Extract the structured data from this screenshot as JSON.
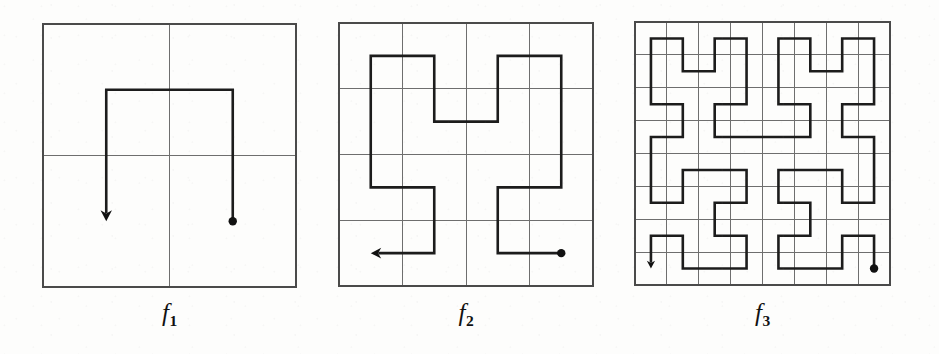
{
  "figure": {
    "background_color": "#fdfdfc",
    "width": 939,
    "height": 354
  },
  "style": {
    "grid_color": "#6e6e6e",
    "grid_width": 1,
    "curve_color": "#1c1c1c",
    "curve_width": 2.6,
    "dot_color": "#111111",
    "dot_radius": 4.2,
    "arrow_color": "#111111",
    "label_color": "#111111"
  },
  "panels": [
    {
      "id": "panel-f1",
      "label": "f",
      "label_subscript": "1",
      "order": 1,
      "grid_divisions": 2,
      "box": {
        "x": 43,
        "y": 24,
        "width": 253,
        "height": 263
      },
      "label_y": 300,
      "start_marker": "dot",
      "end_marker": "arrow",
      "end_direction": "down",
      "segments": 3,
      "cells": 4
    },
    {
      "id": "panel-f2",
      "label": "f",
      "label_subscript": "2",
      "order": 2,
      "grid_divisions": 4,
      "box": {
        "x": 339,
        "y": 23,
        "width": 254,
        "height": 263
      },
      "label_y": 300,
      "start_marker": "dot",
      "end_marker": "arrow",
      "end_direction": "left",
      "segments": 15,
      "cells": 16
    },
    {
      "id": "panel-f3",
      "label": "f",
      "label_subscript": "3",
      "order": 3,
      "grid_divisions": 8,
      "box": {
        "x": 635,
        "y": 22,
        "width": 255,
        "height": 263
      },
      "label_y": 300,
      "start_marker": "dot",
      "end_marker": "arrow",
      "end_direction": "down",
      "segments": 63,
      "cells": 64
    }
  ],
  "chart_data": {
    "type": "line",
    "xlabel": "",
    "ylabel": "",
    "grid": true,
    "legend": "none",
    "series": [
      {
        "name": "f1",
        "divisions": 2,
        "note": "Path visits all 4 cells of a 2x2 grid; starts at dot in lower-right cell, ends with arrow pointing down in lower-left cell.",
        "cell_path": [
          [
            1,
            0
          ],
          [
            1,
            1
          ],
          [
            0,
            1
          ],
          [
            0,
            0
          ]
        ]
      },
      {
        "name": "f2",
        "divisions": 4,
        "note": "Path visits all 16 cells of a 4x4 grid; starts at dot in lower-right cell, ends with arrow pointing left in lower-left cell.",
        "cell_path": [
          [
            3,
            0
          ],
          [
            2,
            0
          ],
          [
            2,
            1
          ],
          [
            3,
            1
          ],
          [
            3,
            2
          ],
          [
            3,
            3
          ],
          [
            2,
            3
          ],
          [
            2,
            2
          ],
          [
            1,
            2
          ],
          [
            1,
            3
          ],
          [
            0,
            3
          ],
          [
            0,
            2
          ],
          [
            0,
            1
          ],
          [
            1,
            1
          ],
          [
            1,
            0
          ],
          [
            0,
            0
          ]
        ]
      },
      {
        "name": "f3",
        "divisions": 8,
        "note": "Path visits all 64 cells of an 8x8 grid; starts at dot in lower-right cell, ends with arrow pointing down in lower-left cell."
      }
    ]
  }
}
